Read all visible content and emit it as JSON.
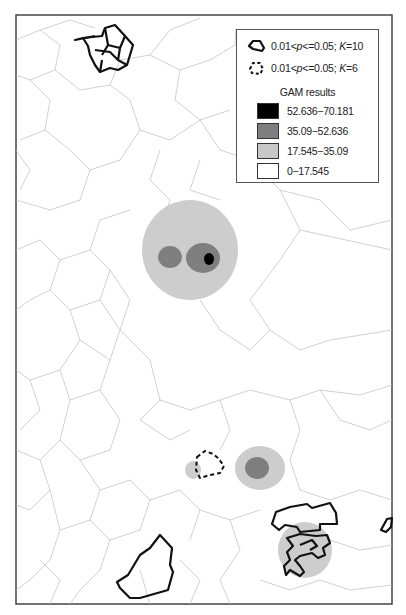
{
  "legend": {
    "items": [
      {
        "symbol": "solid-outline-polygon",
        "prefix": "0.01<",
        "p": "p",
        "mid": "<=0.05; ",
        "k": "K",
        "suffix": "=10"
      },
      {
        "symbol": "dashed-outline-polygon",
        "prefix": "0.01<",
        "p": "p",
        "mid": "<=0.05; ",
        "k": "K",
        "suffix": "=6"
      }
    ],
    "gam_title": "GAM results",
    "classes": [
      {
        "label": "52.636−70.181",
        "color": "#000000"
      },
      {
        "label": "35.09−52.636",
        "color": "#7f7f7f"
      },
      {
        "label": "17.545−35.09",
        "color": "#c8c8c8"
      },
      {
        "label": "0−17.545",
        "color": "#ffffff"
      }
    ]
  },
  "colors": {
    "frame": "#444444",
    "boundary": "#bdbdbd",
    "cluster_outline": "#111111"
  }
}
